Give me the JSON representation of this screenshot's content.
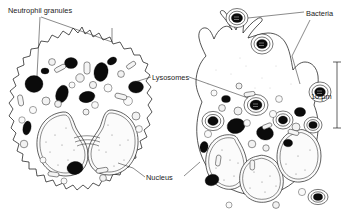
{
  "figure": {
    "type": "scientific-line-illustration",
    "background_color": "#ffffff",
    "ink_color": "#1c1c1c",
    "granule_color": "#0b0b0b"
  },
  "labels": [
    {
      "id": "neutrophil-granules",
      "text": "Neutrophil granules",
      "x": 8,
      "y": 10,
      "anchor": "start"
    },
    {
      "id": "bacteria",
      "text": "Bacteria",
      "x": 306,
      "y": 14,
      "anchor": "start"
    },
    {
      "id": "lysosomes",
      "text": "Lysosomes",
      "x": 152,
      "y": 77,
      "anchor": "start"
    },
    {
      "id": "nucleus",
      "text": "Nucleus",
      "x": 146,
      "y": 179,
      "anchor": "start"
    },
    {
      "id": "scale-label",
      "text": "10 µm",
      "x": 316,
      "y": 100,
      "anchor": "start"
    }
  ],
  "scale_bar": {
    "value": "10 µm",
    "orientation": "vertical",
    "x": 337,
    "y_top": 62,
    "y_bottom": 128
  },
  "cells": [
    {
      "id": "left-cell",
      "name": "resting neutrophil",
      "nucleus_lobes": 2,
      "description": "bilobed nucleus with double nuclear envelope, cytoplasm packed with dark granules and pale vesicles, spiky microvillous membrane"
    },
    {
      "id": "right-cell",
      "name": "phagocytosing neutrophil",
      "nucleus_lobes": 3,
      "description": "pseudopodia engulfing bacteria, bacteria enclosed in phagocytic vacuoles with concentric membranes, dark granules and lysosomes throughout cytoplasm"
    }
  ]
}
